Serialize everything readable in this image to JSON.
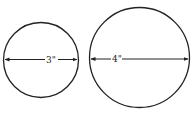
{
  "diagram": {
    "circles": [
      {
        "id": "small",
        "label": "3\"",
        "cx": 41,
        "cy": 60,
        "r": 37.5
      },
      {
        "id": "large",
        "label": "4\"",
        "cx": 139.5,
        "cy": 57.5,
        "r": 50
      }
    ],
    "stroke_color": "#222222",
    "background": "#ffffff"
  }
}
